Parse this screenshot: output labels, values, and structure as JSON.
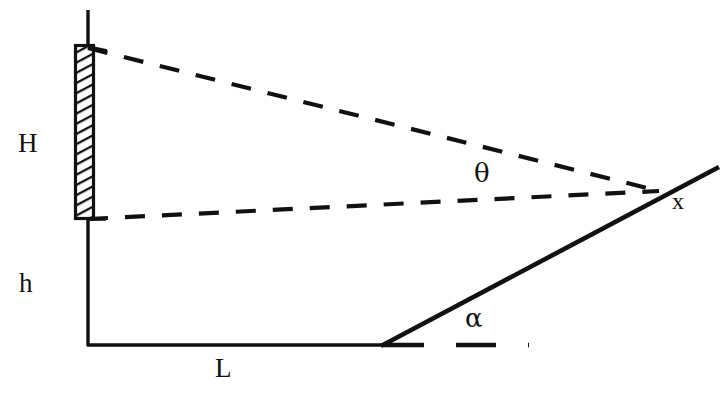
{
  "figure": {
    "kind": "geometry-diagram",
    "background_color": "#ffffff",
    "ink_color": "#111111",
    "width": 727,
    "height": 395
  },
  "labels": {
    "height_upper": "H",
    "height_lower": "h",
    "base_length": "L",
    "view_angle": "θ",
    "slope_angle": "α",
    "distance": "x"
  },
  "geometry": {
    "mast": {
      "name": "vertical-mast-line",
      "x": 88,
      "y_top": 10,
      "y_bottom": 345
    },
    "hatched_block": {
      "name": "hatched-panel",
      "x": 75,
      "y": 45,
      "width": 18,
      "height": 173,
      "hatch": "diagonal"
    },
    "baseline": {
      "name": "horizontal-baseline",
      "x_start": 88,
      "x_end": 381,
      "y": 345
    },
    "incline": {
      "name": "inclined-slope-line",
      "x_start": 381,
      "y_start": 345,
      "x_end": 718,
      "y_end": 168
    },
    "sight_line_upper": {
      "name": "upper-dashed-sight-line",
      "x_start": 88,
      "y_start": 48,
      "x_end": 657,
      "y_end": 191
    },
    "sight_line_lower": {
      "name": "lower-dashed-sight-line",
      "x_start": 88,
      "y_start": 219,
      "x_end": 657,
      "y_end": 191
    },
    "angle_reference": {
      "name": "alpha-reference-dashed-line",
      "x_start": 384,
      "x_end": 527,
      "y": 345
    }
  },
  "label_positions": {
    "height_upper": {
      "x": 18,
      "y": 130
    },
    "height_lower": {
      "x": 19,
      "y": 270
    },
    "base_length": {
      "x": 215,
      "y": 355
    },
    "view_angle": {
      "x": 474,
      "y": 160
    },
    "slope_angle": {
      "x": 465,
      "y": 305
    },
    "distance": {
      "x": 672,
      "y": 189
    }
  }
}
